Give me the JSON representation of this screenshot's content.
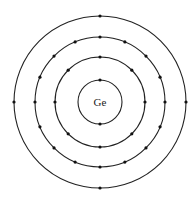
{
  "diagram": {
    "type": "bohr-model",
    "element_symbol": "Ge",
    "center": [
      100,
      102
    ],
    "shells": [
      {
        "radius": 22,
        "electrons": 2
      },
      {
        "radius": 45,
        "electrons": 8
      },
      {
        "radius": 65,
        "electrons": 16
      },
      {
        "radius": 86,
        "electrons": 4
      }
    ],
    "colors": {
      "line": "#222222",
      "dot": "#111111",
      "background": "#ffffff"
    }
  }
}
